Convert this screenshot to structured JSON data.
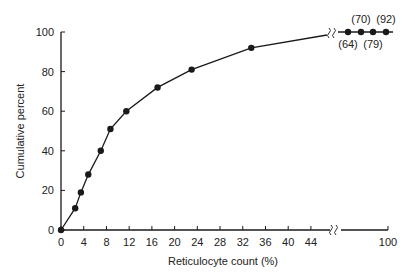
{
  "chart_data": {
    "type": "line",
    "title": "",
    "xlabel": "Reticulocyte count (%)",
    "ylabel": "Cumulative percent",
    "xlim": [
      0,
      100
    ],
    "ylim": [
      0,
      100
    ],
    "grid": false,
    "x_axis_break": {
      "from": 46,
      "to": 96
    },
    "x_ticks": [
      0,
      4,
      8,
      12,
      16,
      20,
      24,
      28,
      32,
      36,
      40,
      44,
      100
    ],
    "y_ticks": [
      0,
      20,
      40,
      60,
      80,
      100
    ],
    "series": [
      {
        "name": "Cumulative percent",
        "points": [
          {
            "x": 0,
            "y": 0
          },
          {
            "x": 2.5,
            "y": 11
          },
          {
            "x": 3.5,
            "y": 19
          },
          {
            "x": 4.8,
            "y": 28
          },
          {
            "x": 7,
            "y": 40
          },
          {
            "x": 8.7,
            "y": 51
          },
          {
            "x": 11.5,
            "y": 60
          },
          {
            "x": 17,
            "y": 72
          },
          {
            "x": 23,
            "y": 81
          },
          {
            "x": 33.5,
            "y": 92
          }
        ]
      },
      {
        "name": "Beyond axis break (values shown in parentheses)",
        "points": [
          {
            "label": "(64)",
            "value": 64,
            "y": 100
          },
          {
            "label": "(70)",
            "value": 70,
            "y": 100
          },
          {
            "label": "(79)",
            "value": 79,
            "y": 100
          },
          {
            "label": "(92)",
            "value": 92,
            "y": 100
          }
        ]
      }
    ],
    "annotations": [
      "(64)",
      "(70)",
      "(79)",
      "(92)"
    ]
  }
}
